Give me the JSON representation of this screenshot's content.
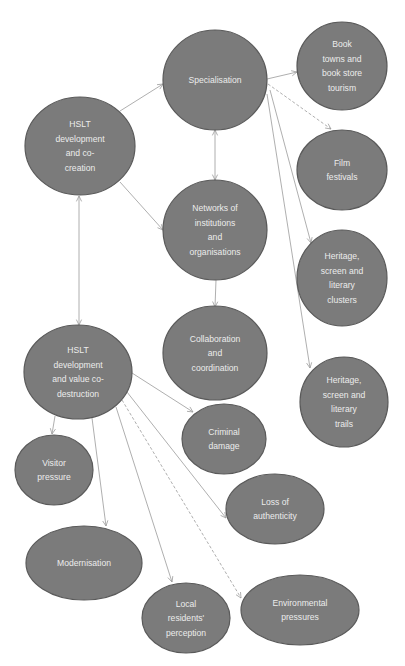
{
  "diagram": {
    "colors": {
      "node_fill": "#7b7b7b",
      "node_stroke": "#5a5a5a",
      "node_text": "#ececec",
      "edge": "#9a9a9a",
      "background": "#ffffff"
    },
    "nodes": [
      {
        "id": "specialisation",
        "lines": [
          "Specialisation"
        ],
        "cx": 215,
        "cy": 80,
        "rx": 52,
        "ry": 50
      },
      {
        "id": "book-towns",
        "lines": [
          "Book",
          "towns and",
          "book store",
          "tourism"
        ],
        "cx": 342,
        "cy": 66,
        "rx": 45,
        "ry": 44
      },
      {
        "id": "film-festivals",
        "lines": [
          "Film",
          "festivals"
        ],
        "cx": 342,
        "cy": 170,
        "rx": 45,
        "ry": 40
      },
      {
        "id": "hslt-co-creation",
        "lines": [
          "HSLT",
          "development",
          "and co-",
          "creation"
        ],
        "cx": 80,
        "cy": 146,
        "rx": 55,
        "ry": 49
      },
      {
        "id": "networks",
        "lines": [
          "Networks of",
          "institutions",
          "and",
          "organisations"
        ],
        "cx": 215,
        "cy": 230,
        "rx": 52,
        "ry": 50
      },
      {
        "id": "heritage-clusters",
        "lines": [
          "Heritage,",
          "screen and",
          "literary",
          "clusters"
        ],
        "cx": 342,
        "cy": 278,
        "rx": 45,
        "ry": 48
      },
      {
        "id": "collaboration",
        "lines": [
          "Collaboration",
          "and",
          "coordination"
        ],
        "cx": 215,
        "cy": 353,
        "rx": 52,
        "ry": 47
      },
      {
        "id": "heritage-trails",
        "lines": [
          "Heritage,",
          "screen and",
          "literary",
          "trails"
        ],
        "cx": 344,
        "cy": 402,
        "rx": 44,
        "ry": 45
      },
      {
        "id": "hslt-co-destruction",
        "lines": [
          "HSLT",
          "development",
          "and value co-",
          "destruction"
        ],
        "cx": 78,
        "cy": 372,
        "rx": 54,
        "ry": 47
      },
      {
        "id": "criminal-damage",
        "lines": [
          "Criminal",
          "damage"
        ],
        "cx": 224,
        "cy": 439,
        "rx": 42,
        "ry": 35
      },
      {
        "id": "visitor-pressure",
        "lines": [
          "Visitor",
          "pressure"
        ],
        "cx": 54,
        "cy": 470,
        "rx": 39,
        "ry": 35
      },
      {
        "id": "loss-of-authenticity",
        "lines": [
          "Loss of",
          "authenticity"
        ],
        "cx": 275,
        "cy": 509,
        "rx": 49,
        "ry": 35
      },
      {
        "id": "modernisation",
        "lines": [
          "Modernisation"
        ],
        "cx": 84,
        "cy": 563,
        "rx": 58,
        "ry": 37
      },
      {
        "id": "local-residents",
        "lines": [
          "Local",
          "residents'",
          "perception"
        ],
        "cx": 186,
        "cy": 618,
        "rx": 44,
        "ry": 35
      },
      {
        "id": "environmental-pressures",
        "lines": [
          "Environmental",
          "pressures"
        ],
        "cx": 300,
        "cy": 610,
        "rx": 59,
        "ry": 35
      }
    ],
    "edges": [
      {
        "from": "hslt-co-creation",
        "to": "specialisation",
        "x1": 120,
        "y1": 111,
        "x2": 163,
        "y2": 84,
        "start_arrow": false,
        "end_arrow": true,
        "dashed": false
      },
      {
        "from": "hslt-co-creation",
        "to": "networks",
        "x1": 120,
        "y1": 182,
        "x2": 163,
        "y2": 230,
        "start_arrow": false,
        "end_arrow": true,
        "dashed": false
      },
      {
        "from": "hslt-co-creation",
        "to": "hslt-co-destruction",
        "x1": 79,
        "y1": 196,
        "x2": 79,
        "y2": 325,
        "start_arrow": true,
        "end_arrow": true,
        "dashed": false
      },
      {
        "from": "specialisation",
        "to": "networks",
        "x1": 215,
        "y1": 130,
        "x2": 215,
        "y2": 180,
        "start_arrow": true,
        "end_arrow": true,
        "dashed": false
      },
      {
        "from": "specialisation",
        "to": "book-towns",
        "x1": 267,
        "y1": 79,
        "x2": 297,
        "y2": 72,
        "start_arrow": false,
        "end_arrow": true,
        "dashed": false
      },
      {
        "from": "specialisation",
        "to": "film-festivals",
        "x1": 268,
        "y1": 84,
        "x2": 331,
        "y2": 129,
        "start_arrow": false,
        "end_arrow": true,
        "dashed": true
      },
      {
        "from": "specialisation",
        "to": "heritage-clusters",
        "x1": 270,
        "y1": 90,
        "x2": 311,
        "y2": 243,
        "start_arrow": false,
        "end_arrow": true,
        "dashed": false
      },
      {
        "from": "specialisation",
        "to": "heritage-trails",
        "x1": 267,
        "y1": 94,
        "x2": 310,
        "y2": 368,
        "start_arrow": false,
        "end_arrow": true,
        "dashed": false
      },
      {
        "from": "networks",
        "to": "collaboration",
        "x1": 216,
        "y1": 280,
        "x2": 215,
        "y2": 307,
        "start_arrow": false,
        "end_arrow": true,
        "dashed": false
      },
      {
        "from": "hslt-co-destruction",
        "to": "criminal-damage",
        "x1": 132,
        "y1": 373,
        "x2": 193,
        "y2": 412,
        "start_arrow": false,
        "end_arrow": true,
        "dashed": false
      },
      {
        "from": "hslt-co-destruction",
        "to": "loss-of-authenticity",
        "x1": 127,
        "y1": 392,
        "x2": 226,
        "y2": 518,
        "start_arrow": false,
        "end_arrow": true,
        "dashed": false
      },
      {
        "from": "hslt-co-destruction",
        "to": "environmental-pressures",
        "x1": 122,
        "y1": 400,
        "x2": 241,
        "y2": 598,
        "start_arrow": false,
        "end_arrow": true,
        "dashed": true
      },
      {
        "from": "hslt-co-destruction",
        "to": "local-residents",
        "x1": 116,
        "y1": 407,
        "x2": 172,
        "y2": 582,
        "start_arrow": false,
        "end_arrow": true,
        "dashed": false
      },
      {
        "from": "hslt-co-destruction",
        "to": "modernisation",
        "x1": 92,
        "y1": 418,
        "x2": 106,
        "y2": 526,
        "start_arrow": false,
        "end_arrow": true,
        "dashed": false
      },
      {
        "from": "hslt-co-destruction",
        "to": "visitor-pressure",
        "x1": 55,
        "y1": 416,
        "x2": 52,
        "y2": 434,
        "start_arrow": false,
        "end_arrow": true,
        "dashed": false
      }
    ]
  }
}
